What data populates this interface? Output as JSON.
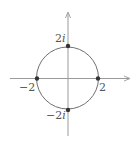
{
  "diagram": {
    "type": "complex-plane-circle",
    "colors": {
      "axis": "#9a9a9a",
      "circle": "#707070",
      "point": "#333333",
      "label": "#555555"
    },
    "axes": {
      "horizontal": {
        "x1": 10,
        "y": 78.5,
        "x2": 130
      },
      "vertical": {
        "x": 68,
        "y1": 136,
        "y2": 12
      }
    },
    "circle": {
      "cx": 67.5,
      "cy": 78,
      "r": 31,
      "radius_value": 2
    },
    "points": [
      {
        "name": "top",
        "label_real": "2",
        "label_imag": "i",
        "x": 68,
        "y": 46
      },
      {
        "name": "bottom",
        "label_real": "−2",
        "label_imag": "i",
        "x": 68,
        "y": 110
      },
      {
        "name": "left",
        "label_real": "−2",
        "label_imag": "",
        "x": 37,
        "y": 78
      },
      {
        "name": "right",
        "label_real": "2",
        "label_imag": "",
        "x": 98,
        "y": 78
      }
    ]
  }
}
